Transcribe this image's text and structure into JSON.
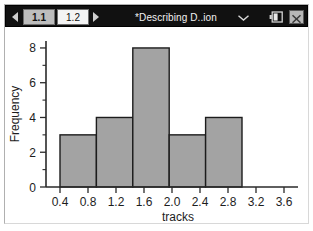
{
  "window": {
    "title": "*Describing D..ion",
    "tabs": [
      {
        "label": "1.1",
        "selected": true
      },
      {
        "label": "1.2",
        "selected": false
      }
    ],
    "nav_prev_icon": "triangle-left-icon",
    "nav_next_icon": "triangle-right-icon",
    "title_menu_icon": "chevron-down-icon",
    "battery_icon": "battery-icon",
    "close_icon": "close-icon",
    "titlebar_color": "#111111",
    "tab_selected_color": "#bdbdbd",
    "tab_unselected_color": "#f4f4f4"
  },
  "chart_data": {
    "type": "bar",
    "title": "",
    "xlabel": "tracks",
    "ylabel": "Frequency",
    "categories": [
      "0.4-0.92",
      "0.92-1.44",
      "1.44-1.96",
      "1.96-2.48",
      "2.48-3.0"
    ],
    "bin_edges": [
      0.4,
      0.92,
      1.44,
      1.96,
      2.48,
      3.0
    ],
    "values": [
      3,
      4,
      8,
      3,
      4
    ],
    "xlim": [
      0.2,
      3.8
    ],
    "ylim": [
      0,
      8.4
    ],
    "xticks": [
      0.4,
      0.8,
      1.2,
      1.6,
      2.0,
      2.4,
      2.8,
      3.2,
      3.6
    ],
    "xtick_labels": [
      "0.4",
      "0.8",
      "1.2",
      "1.6",
      "2.0",
      "2.4",
      "2.8",
      "3.2",
      "3.6"
    ],
    "yticks": [
      0,
      2,
      4,
      6,
      8
    ],
    "ytick_labels": [
      "0",
      "2",
      "4",
      "6",
      "8"
    ],
    "y_minor_ticks": [
      1,
      3,
      5,
      7
    ],
    "grid": false,
    "legend": false,
    "bar_fill_color": "#a3a3a3",
    "bar_edge_color": "#1c1c1c",
    "axis_color": "#2a2a2a",
    "plot_background": "#ffffff"
  }
}
